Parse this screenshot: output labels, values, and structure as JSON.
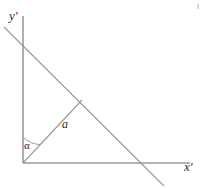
{
  "figure": {
    "background_color": "#ffffff",
    "line_color": "#9a9a9a",
    "label_color": "#2b2b2b",
    "width": 206,
    "height": 189,
    "labels": {
      "y_axis": "y'",
      "x_axis": "x'",
      "vector": "a",
      "angle": "α"
    },
    "geometry": {
      "origin": {
        "x": 23,
        "y": 163
      },
      "x_axis_end": {
        "x": 190,
        "y": 163
      },
      "y_axis_top": {
        "x": 23,
        "y": 16
      },
      "vector_tip": {
        "x": 82,
        "y": 100
      },
      "diagonal_start": {
        "x": 4,
        "y": 27
      },
      "diagonal_end": {
        "x": 164,
        "y": 186
      },
      "arc_radius": 26,
      "angle_from_y_axis_degrees": 43
    }
  }
}
